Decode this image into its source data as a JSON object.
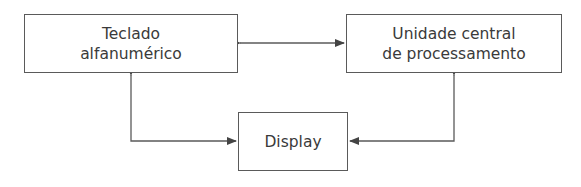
{
  "diagram": {
    "nodes": [
      {
        "id": "teclado",
        "lines": [
          "Teclado",
          "alfanumérico"
        ]
      },
      {
        "id": "ucp",
        "lines": [
          "Unidade central",
          "de processamento"
        ]
      },
      {
        "id": "display",
        "lines": [
          "Display"
        ]
      }
    ],
    "edges": [
      {
        "from": "teclado",
        "to": "ucp",
        "direction": "bidirectional"
      },
      {
        "from": "teclado",
        "to": "display",
        "direction": "bidirectional"
      },
      {
        "from": "ucp",
        "to": "display",
        "direction": "bidirectional"
      }
    ],
    "colors": {
      "stroke": "#5a5a5a",
      "text": "#3a3a3a",
      "background": "#ffffff"
    }
  }
}
